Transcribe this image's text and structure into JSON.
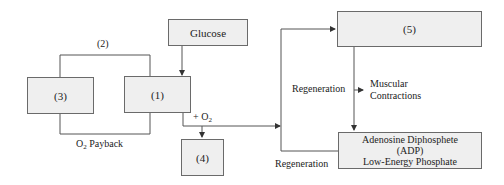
{
  "diagram": {
    "nodes": [
      {
        "id": "glucose",
        "label": "Glucose"
      },
      {
        "id": "n1",
        "label": "(1)"
      },
      {
        "id": "n3",
        "label": "(3)"
      },
      {
        "id": "n4",
        "label": "(4)"
      },
      {
        "id": "n5",
        "label": "(5)"
      },
      {
        "id": "adp",
        "label_line1": "Adenosine Diphosphete",
        "label_line2": "(ADP)",
        "label_line3": "Low-Energy Phosphate"
      }
    ],
    "edge_labels": {
      "loop_top": "(2)",
      "loop_bottom_prefix": "O",
      "loop_bottom_sub": "2",
      "loop_bottom_suffix": " Payback",
      "oxygen_prefix": "+ O",
      "oxygen_sub": "2",
      "regeneration_upper": "Regeneration",
      "regeneration_lower": "Regeneration",
      "muscular_line1": "Muscular",
      "muscular_line2": "Contractions"
    },
    "colors": {
      "box_fill": "#efefef",
      "box_border": "#6a6a6a",
      "line": "#444444"
    }
  }
}
